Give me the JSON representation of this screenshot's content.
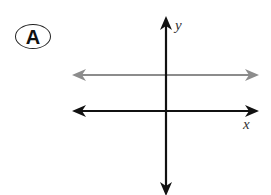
{
  "figure": {
    "choice_label": "A",
    "axes": {
      "x_label": "x",
      "y_label": "y"
    },
    "lines": [
      {
        "name": "horizontal-line-above-x-axis",
        "orientation": "horizontal",
        "color": "#8c8c8c",
        "position": "above x-axis",
        "arrows": "both ends"
      },
      {
        "name": "x-axis",
        "orientation": "horizontal",
        "color": "#111111",
        "arrows": "both ends"
      },
      {
        "name": "y-axis",
        "orientation": "vertical",
        "color": "#111111",
        "arrows": "both ends"
      }
    ],
    "colors": {
      "axis": "#111111",
      "graph_line": "#8c8c8c",
      "background": "#ffffff"
    }
  }
}
